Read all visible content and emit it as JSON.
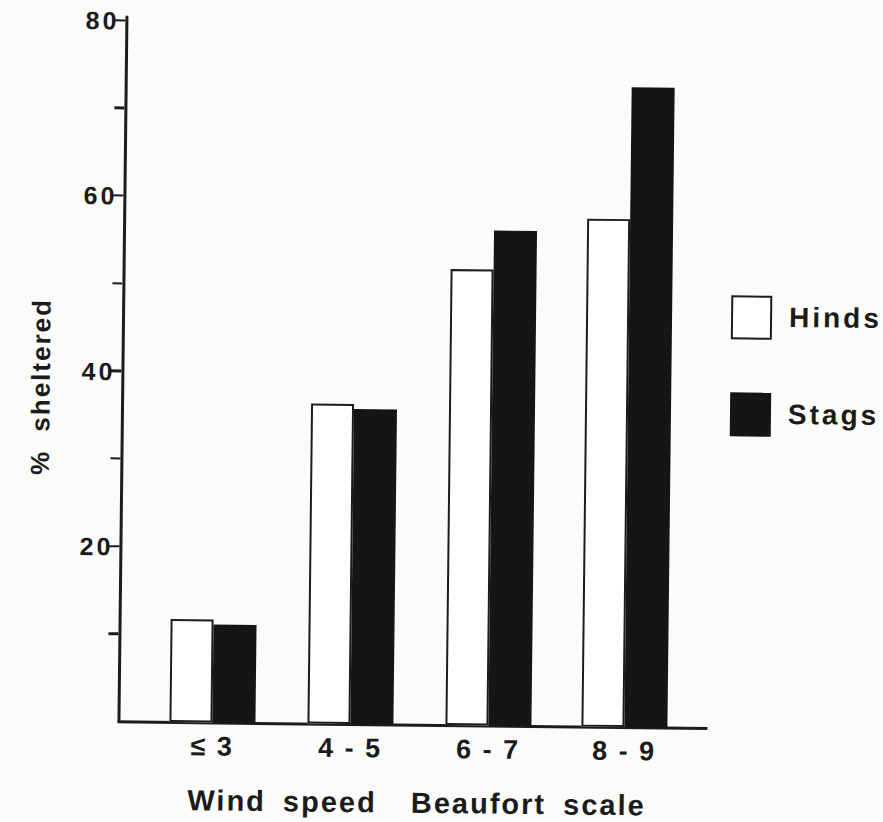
{
  "chart_data": {
    "type": "bar",
    "title": "",
    "xlabel": "Wind speed  Beaufort scale",
    "ylabel": "% sheltered",
    "categories": [
      "≤ 3",
      "4 - 5",
      "6 - 7",
      "8 - 9"
    ],
    "series": [
      {
        "name": "Hinds",
        "style": "open",
        "fill": "#ffffff",
        "values": [
          11.8,
          36.5,
          52,
          58
        ]
      },
      {
        "name": "Stags",
        "style": "filled",
        "fill": "#151515",
        "values": [
          11.2,
          36,
          56.5,
          73
        ]
      }
    ],
    "ylim": [
      0,
      80
    ],
    "yticks_labeled": [
      20,
      40,
      60,
      80
    ],
    "yticks_minor": [
      10,
      30,
      50,
      70
    ],
    "grid": false,
    "legend_position": "right"
  },
  "colors": {
    "ink": "#1c1c1c",
    "bar_black": "#151515",
    "paper": "#fbfbf9"
  }
}
